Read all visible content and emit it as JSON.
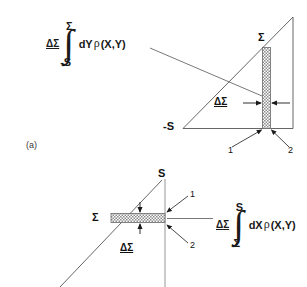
{
  "figure": {
    "panel_label": "(a)",
    "background": "#ffffff",
    "line_color": "#555555",
    "hatch_color": "#9a9a9a",
    "text_color": "#111111"
  },
  "upper_diagram": {
    "name": "dY-integration-diagram",
    "axis_labels": {
      "apex_sigma": "Σ",
      "origin_minus_s": "-S"
    },
    "strip": {
      "orientation": "vertical",
      "width_label": "ΔΣ",
      "edge_labels": [
        "1",
        "2"
      ]
    },
    "expression": {
      "prefix": "ΔΣ",
      "upper_limit": "Σ",
      "lower_limit": "-S",
      "differential": "dY",
      "density": "ρ",
      "arguments": "(X,Y)"
    }
  },
  "lower_diagram": {
    "name": "dX-integration-diagram",
    "axis_labels": {
      "top_s": "S",
      "left_sigma": "Σ"
    },
    "strip": {
      "orientation": "horizontal",
      "thickness_label": "ΔΣ",
      "edge_labels": [
        "1",
        "2"
      ]
    },
    "expression": {
      "prefix": "ΔΣ",
      "upper_limit": "S",
      "lower_limit": "Σ",
      "differential": "dX",
      "density": "ρ",
      "arguments": "(X,Y)"
    }
  }
}
